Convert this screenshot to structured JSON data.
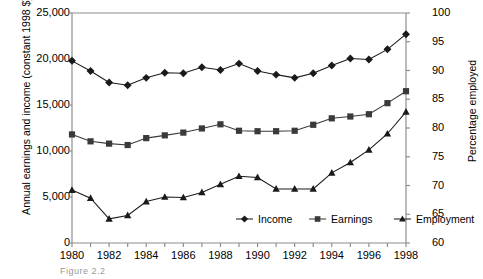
{
  "chart_data": {
    "type": "line",
    "title": "",
    "xlabel": "",
    "ylabel": "Annual earnings and income (constant 1998 $)",
    "y2label": "Percentage employed",
    "x": [
      1980,
      1981,
      1982,
      1983,
      1984,
      1985,
      1986,
      1987,
      1988,
      1989,
      1990,
      1991,
      1992,
      1993,
      1994,
      1995,
      1996,
      1997,
      1998
    ],
    "xlim": [
      1980,
      1998
    ],
    "ylim": [
      0,
      25000
    ],
    "y2lim": [
      60,
      100
    ],
    "yticks": [
      "0",
      "5,000",
      "10,000",
      "15,000",
      "20,000",
      "25,000"
    ],
    "ytick_values": [
      0,
      5000,
      10000,
      15000,
      20000,
      25000
    ],
    "y2ticks": [
      "60",
      "65",
      "70",
      "75",
      "80",
      "85",
      "90",
      "95",
      "100"
    ],
    "y2tick_values": [
      60,
      65,
      70,
      75,
      80,
      85,
      90,
      95,
      100
    ],
    "xticks": [
      "1980",
      "1982",
      "1984",
      "1986",
      "1988",
      "1990",
      "1992",
      "1994",
      "1996",
      "1998"
    ],
    "xtick_values": [
      1980,
      1982,
      1984,
      1986,
      1988,
      1990,
      1992,
      1994,
      1996,
      1998
    ],
    "grid": false,
    "legend_position": "inside-bottom-center",
    "series": [
      {
        "name": "Income",
        "axis": "left",
        "marker": "diamond",
        "color": "#1a1a1a",
        "values": [
          19800,
          18700,
          17450,
          17150,
          17950,
          18500,
          18450,
          19100,
          18800,
          19500,
          18700,
          18300,
          17950,
          18450,
          19300,
          20050,
          19950,
          21050,
          22700
        ]
      },
      {
        "name": "Earnings",
        "axis": "left",
        "marker": "square",
        "color": "#3a3a3a",
        "values": [
          11800,
          11050,
          10800,
          10650,
          11400,
          11700,
          12000,
          12450,
          12900,
          12200,
          12150,
          12150,
          12200,
          12850,
          13550,
          13750,
          14000,
          15200,
          16500
        ]
      },
      {
        "name": "Employment",
        "axis": "right",
        "marker": "triangle",
        "color": "#1a1a1a",
        "values": [
          69.2,
          67.8,
          64.2,
          64.8,
          67.2,
          68.0,
          67.9,
          68.8,
          70.2,
          71.6,
          71.4,
          69.4,
          69.4,
          69.4,
          72.2,
          74.0,
          76.2,
          79.0,
          82.8
        ]
      }
    ]
  },
  "legend": {
    "items": [
      {
        "label": "Income",
        "marker": "diamond"
      },
      {
        "label": "Earnings",
        "marker": "square"
      },
      {
        "label": "Employment",
        "marker": "triangle"
      }
    ]
  },
  "caption": "Figure 2.2"
}
